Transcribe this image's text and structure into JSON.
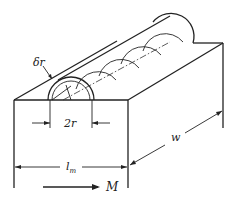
{
  "figure": {
    "type": "isometric mechanical diagram",
    "labels": {
      "shell_thickness": "δr",
      "diameter": "2r",
      "width": "w",
      "length": "l",
      "length_subscript": "m",
      "direction": "M"
    },
    "colors": {
      "line": "#222222",
      "background": "#ffffff"
    }
  }
}
